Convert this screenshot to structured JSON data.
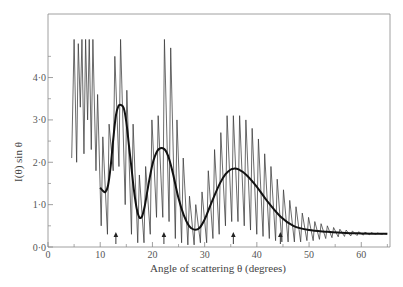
{
  "chart_data": {
    "type": "line",
    "title": "",
    "xlabel": "Angle of scattering θ (degrees)",
    "ylabel": "I(θ) sin θ",
    "xlim": [
      0,
      65.5
    ],
    "ylim": [
      0,
      5.5
    ],
    "grid": false,
    "legend": null,
    "x_ticks": [
      0,
      10,
      20,
      30,
      40,
      50,
      60
    ],
    "x_tick_labels": [
      "0",
      "10",
      "20",
      "30",
      "40",
      "50",
      "60"
    ],
    "x_minor_ticks": [
      5,
      15,
      25,
      35,
      45,
      55,
      65
    ],
    "y_ticks": [
      0,
      1,
      2,
      3,
      4
    ],
    "y_tick_labels": [
      "0·0",
      "1·0",
      "2·0",
      "3·0",
      "4·0"
    ],
    "y_minor_ticks": [
      0.5,
      1.5,
      2.5,
      3.5,
      4.5
    ],
    "arrows_at_theta": [
      13.0,
      22.2,
      35.5,
      44.5
    ],
    "series": [
      {
        "name": "smooth-average",
        "style": "thick",
        "x": [
          10.0,
          10.5,
          11.0,
          11.5,
          12.0,
          12.5,
          13.0,
          13.5,
          14.0,
          14.5,
          15.0,
          15.5,
          16.0,
          16.5,
          17.0,
          17.5,
          18.0,
          18.5,
          19.0,
          19.5,
          20.0,
          20.5,
          21.0,
          21.5,
          22.0,
          22.5,
          23.0,
          23.5,
          24.0,
          25.0,
          26.0,
          27.0,
          28.0,
          29.0,
          30.0,
          31.0,
          32.0,
          33.0,
          34.0,
          35.0,
          35.6,
          36.5,
          38.0,
          40.0,
          42.0,
          44.5,
          47.0,
          50.0,
          53.5,
          57.0,
          60.0,
          65.0
        ],
        "values": [
          1.4,
          1.33,
          1.3,
          1.45,
          1.9,
          2.55,
          3.1,
          3.33,
          3.35,
          3.28,
          2.95,
          2.4,
          1.85,
          1.3,
          0.9,
          0.7,
          0.72,
          0.95,
          1.3,
          1.65,
          1.95,
          2.15,
          2.28,
          2.33,
          2.33,
          2.28,
          2.15,
          1.95,
          1.7,
          1.15,
          0.75,
          0.5,
          0.41,
          0.45,
          0.65,
          0.95,
          1.25,
          1.52,
          1.72,
          1.83,
          1.85,
          1.83,
          1.7,
          1.42,
          1.08,
          0.72,
          0.5,
          0.4,
          0.36,
          0.33,
          0.32,
          0.31
        ]
      },
      {
        "name": "measured-intensity",
        "style": "thin",
        "oscillation_period_deg": 1.25,
        "peaks": [
          {
            "theta": 5.0,
            "max": 4.9,
            "min": 2.1
          },
          {
            "theta": 5.8,
            "max": 4.8,
            "min": 2.0
          },
          {
            "theta": 6.5,
            "max": 4.9,
            "min": 3.3
          },
          {
            "theta": 7.2,
            "max": 4.9,
            "min": 2.2
          },
          {
            "theta": 7.9,
            "max": 4.9,
            "min": 3.0
          },
          {
            "theta": 8.6,
            "max": 4.9,
            "min": 2.3
          },
          {
            "theta": 9.5,
            "max": 3.6,
            "min": 1.8
          },
          {
            "theta": 10.5,
            "max": 2.6,
            "min": 0.5
          },
          {
            "theta": 11.7,
            "max": 2.9,
            "min": 0.3
          },
          {
            "theta": 12.8,
            "max": 4.5,
            "min": 1.8
          },
          {
            "theta": 13.9,
            "max": 4.9,
            "min": 1.9
          },
          {
            "theta": 15.1,
            "max": 3.7,
            "min": 1.0
          },
          {
            "theta": 16.3,
            "max": 2.9,
            "min": 0.3
          },
          {
            "theta": 17.5,
            "max": 1.7,
            "min": 0.1
          },
          {
            "theta": 18.7,
            "max": 1.9,
            "min": 0.1
          },
          {
            "theta": 19.9,
            "max": 3.0,
            "min": 0.3
          },
          {
            "theta": 21.1,
            "max": 3.1,
            "min": 0.7
          },
          {
            "theta": 22.3,
            "max": 4.9,
            "min": 0.7
          },
          {
            "theta": 23.5,
            "max": 4.7,
            "min": 0.6
          },
          {
            "theta": 24.7,
            "max": 3.0,
            "min": 0.2
          },
          {
            "theta": 25.9,
            "max": 2.1,
            "min": 0.1
          },
          {
            "theta": 27.1,
            "max": 1.2,
            "min": 0.05
          },
          {
            "theta": 28.3,
            "max": 1.0,
            "min": 0.05
          },
          {
            "theta": 29.5,
            "max": 1.3,
            "min": 0.1
          },
          {
            "theta": 30.7,
            "max": 1.8,
            "min": 0.1
          },
          {
            "theta": 31.9,
            "max": 2.3,
            "min": 0.2
          },
          {
            "theta": 33.1,
            "max": 2.7,
            "min": 0.3
          },
          {
            "theta": 34.3,
            "max": 3.1,
            "min": 0.5
          },
          {
            "theta": 35.5,
            "max": 3.1,
            "min": 0.6
          },
          {
            "theta": 36.7,
            "max": 3.1,
            "min": 0.6
          },
          {
            "theta": 37.9,
            "max": 3.0,
            "min": 0.5
          },
          {
            "theta": 39.1,
            "max": 2.8,
            "min": 0.4
          },
          {
            "theta": 40.3,
            "max": 2.55,
            "min": 0.3
          },
          {
            "theta": 41.5,
            "max": 2.2,
            "min": 0.25
          },
          {
            "theta": 42.7,
            "max": 1.9,
            "min": 0.2
          },
          {
            "theta": 43.9,
            "max": 1.6,
            "min": 0.15
          },
          {
            "theta": 45.1,
            "max": 1.35,
            "min": 0.12
          },
          {
            "theta": 46.3,
            "max": 1.1,
            "min": 0.12
          },
          {
            "theta": 47.5,
            "max": 0.95,
            "min": 0.12
          },
          {
            "theta": 48.7,
            "max": 0.8,
            "min": 0.12
          },
          {
            "theta": 49.9,
            "max": 0.7,
            "min": 0.15
          },
          {
            "theta": 51.1,
            "max": 0.6,
            "min": 0.15
          },
          {
            "theta": 52.3,
            "max": 0.55,
            "min": 0.18
          },
          {
            "theta": 53.5,
            "max": 0.5,
            "min": 0.2
          },
          {
            "theta": 54.7,
            "max": 0.46,
            "min": 0.22
          },
          {
            "theta": 55.9,
            "max": 0.42,
            "min": 0.24
          },
          {
            "theta": 57.1,
            "max": 0.4,
            "min": 0.25
          },
          {
            "theta": 58.3,
            "max": 0.38,
            "min": 0.26
          },
          {
            "theta": 59.5,
            "max": 0.36,
            "min": 0.27
          },
          {
            "theta": 60.7,
            "max": 0.35,
            "min": 0.28
          },
          {
            "theta": 61.9,
            "max": 0.34,
            "min": 0.29
          },
          {
            "theta": 63.1,
            "max": 0.33,
            "min": 0.3
          },
          {
            "theta": 64.3,
            "max": 0.32,
            "min": 0.3
          }
        ]
      }
    ]
  },
  "labels": {
    "xlabel": "Angle of scattering θ (degrees)",
    "ylabel_main": "I(θ) sin θ"
  },
  "colors": {
    "axis": "#888888",
    "fine_line": "#3a3a3a",
    "smooth_line": "#111111",
    "text": "#555555"
  }
}
